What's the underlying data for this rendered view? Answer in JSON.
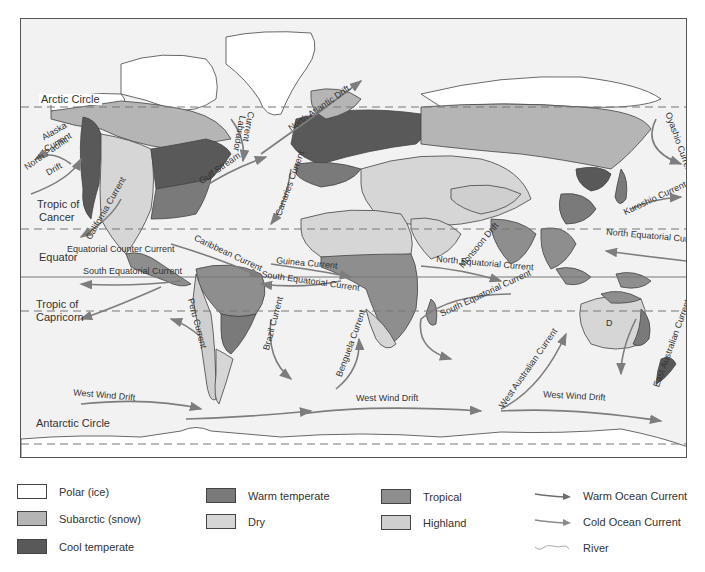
{
  "map": {
    "title": "World climate regions and ocean currents",
    "reference_lines": [
      {
        "label": "Arctic Circle",
        "y": 88
      },
      {
        "label": "Tropic of Cancer",
        "y": 210
      },
      {
        "label": "Equator",
        "y": 258
      },
      {
        "label": "Tropic of Capricorn",
        "y": 292
      },
      {
        "label": "Antarctic Circle",
        "y": 425
      }
    ],
    "line_labels": {
      "arctic_circle": "Arctic Circle",
      "tropic_cancer_1": "Tropic of",
      "tropic_cancer_2": "Cancer",
      "equator": "Equator",
      "tropic_capricorn_1": "Tropic of",
      "tropic_capricorn_2": "Capricorn",
      "antarctic_circle": "Antarctic Circle"
    },
    "currents": {
      "alaska": "Alaska",
      "alaska_current": "Current",
      "north_pacific": "North Pacific",
      "north_pacific_drift": "Drift",
      "california": "California Current",
      "labrador": "Labrador",
      "labrador_current": "Current",
      "gulf_stream": "Gulf Stream",
      "north_atlantic_drift": "North Atlantic Drift",
      "canaries": "Canaries Current",
      "caribbean": "Caribbean Current",
      "equatorial_counter": "Equatorial Counter Current",
      "south_equatorial_w": "South Equatorial Current",
      "guinea": "Guinea Current",
      "south_equatorial_atl": "South Equatorial Current",
      "peru": "Peru Current",
      "brazil": "Brazil Current",
      "benguela": "Benguela Current",
      "monsoon": "Monsoon Drift",
      "north_equatorial_io": "North Equatorial Current",
      "south_equatorial_io": "South Equatorial Current",
      "west_australian": "West Australian Current",
      "east_australian": "East Australian Current",
      "kuroshio": "Kuroshio Current",
      "oyashio": "Oyashio Current",
      "north_equatorial_pac": "North Equatorial Current",
      "west_wind_drift_1": "West Wind Drift",
      "west_wind_drift_2": "West Wind Drift",
      "west_wind_drift_3": "West Wind Drift"
    },
    "region_marker": "D",
    "colors": {
      "ocean": "#f2f2f2",
      "polar": "#ffffff",
      "subarctic": "#b5b5b5",
      "cool_temperate": "#595959",
      "warm_temperate": "#7a7a7a",
      "dry": "#d6d6d6",
      "tropical": "#8e8e8e",
      "highland": "#cfcfcf",
      "current": "#7d7d7d",
      "border": "#444444"
    }
  },
  "legend": {
    "climate": [
      {
        "label": "Polar (ice)",
        "color": "#ffffff"
      },
      {
        "label": "Subarctic (snow)",
        "color": "#b5b5b5"
      },
      {
        "label": "Cool temperate",
        "color": "#595959"
      },
      {
        "label": "Warm temperate",
        "color": "#7a7a7a"
      },
      {
        "label": "Dry",
        "color": "#d6d6d6"
      },
      {
        "label": "Tropical",
        "color": "#8e8e8e"
      },
      {
        "label": "Highland",
        "color": "#cfcfcf"
      }
    ],
    "lines": [
      {
        "label": "Warm Ocean Current"
      },
      {
        "label": "Cold Ocean Current"
      },
      {
        "label": "River"
      }
    ]
  }
}
